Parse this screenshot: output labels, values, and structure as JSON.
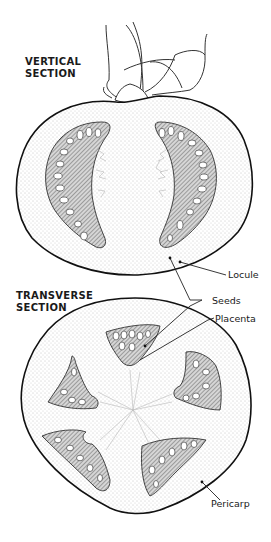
{
  "diagram": {
    "sections": [
      {
        "title_line1": "VERTICAL",
        "title_line2": "SECTION"
      },
      {
        "title_line1": "TRANSVERSE",
        "title_line2": "SECTION"
      }
    ],
    "labels": {
      "locule": "Locule",
      "seeds": "Seeds",
      "placenta": "Placenta",
      "pericarp": "Pericarp"
    },
    "colors": {
      "outline": "#1a1a1a",
      "flesh_stipple": "#9a9a9a",
      "locule_fill": "#8a8a8a",
      "seed_fill": "#ffffff",
      "background": "#ffffff"
    }
  }
}
